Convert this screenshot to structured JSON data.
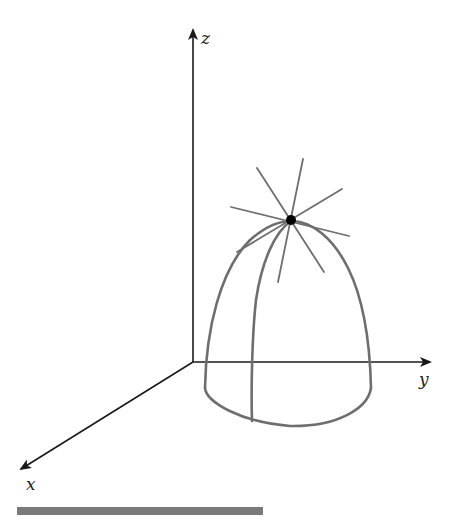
{
  "figure": {
    "type": "3d-surface-diagram",
    "axes": {
      "x": {
        "label": "x"
      },
      "y": {
        "label": "y"
      },
      "z": {
        "label": "z"
      }
    },
    "colors": {
      "axis": "#1a1a1a",
      "surface_curve": "#6e6e6e",
      "rays": "#6e6e6e",
      "point": "#000000",
      "bottom_bar": "#7a7a7a"
    },
    "point": {
      "label": ""
    }
  }
}
